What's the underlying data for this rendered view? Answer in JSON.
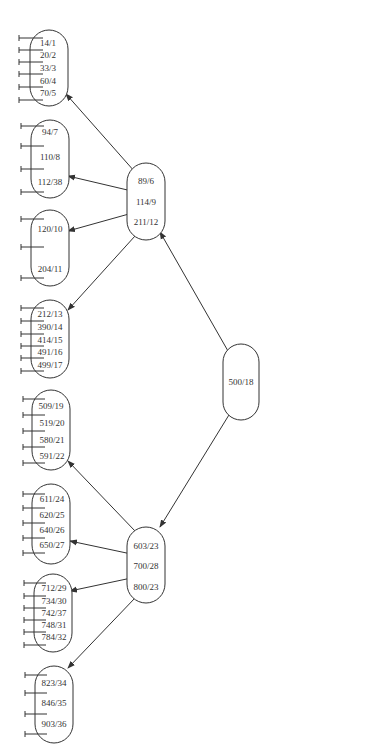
{
  "diagram": {
    "type": "b-plus-tree",
    "root": {
      "id": "root",
      "keys": [
        "500/18"
      ]
    },
    "internal": [
      {
        "id": "int-left",
        "keys": [
          "89/6",
          "114/9",
          "211/12"
        ]
      },
      {
        "id": "int-right",
        "keys": [
          "603/23",
          "700/28",
          "800/23"
        ]
      }
    ],
    "leaves": [
      {
        "id": "leaf-1",
        "keys": [
          "14/1",
          "20/2",
          "33/3",
          "60/4",
          "70/5"
        ]
      },
      {
        "id": "leaf-2",
        "keys": [
          "94/7",
          "110/8",
          "112/38"
        ]
      },
      {
        "id": "leaf-3",
        "keys": [
          "120/10",
          "204/11"
        ]
      },
      {
        "id": "leaf-4",
        "keys": [
          "212/13",
          "390/14",
          "414/15",
          "491/16",
          "499/17"
        ]
      },
      {
        "id": "leaf-5",
        "keys": [
          "509/19",
          "519/20",
          "580/21",
          "591/22"
        ]
      },
      {
        "id": "leaf-6",
        "keys": [
          "611/24",
          "620/25",
          "640/26",
          "650/27"
        ]
      },
      {
        "id": "leaf-7",
        "keys": [
          "712/29",
          "734/30",
          "742/37",
          "748/31",
          "784/32"
        ]
      },
      {
        "id": "leaf-8",
        "keys": [
          "823/34",
          "846/35",
          "903/36"
        ]
      }
    ],
    "edges": [
      {
        "from": "root",
        "to": "int-left"
      },
      {
        "from": "root",
        "to": "int-right"
      },
      {
        "from": "int-left",
        "to": "leaf-1"
      },
      {
        "from": "int-left",
        "to": "leaf-2"
      },
      {
        "from": "int-left",
        "to": "leaf-3"
      },
      {
        "from": "int-left",
        "to": "leaf-4"
      },
      {
        "from": "int-right",
        "to": "leaf-5"
      },
      {
        "from": "int-right",
        "to": "leaf-6"
      },
      {
        "from": "int-right",
        "to": "leaf-7"
      },
      {
        "from": "int-right",
        "to": "leaf-8"
      }
    ]
  }
}
